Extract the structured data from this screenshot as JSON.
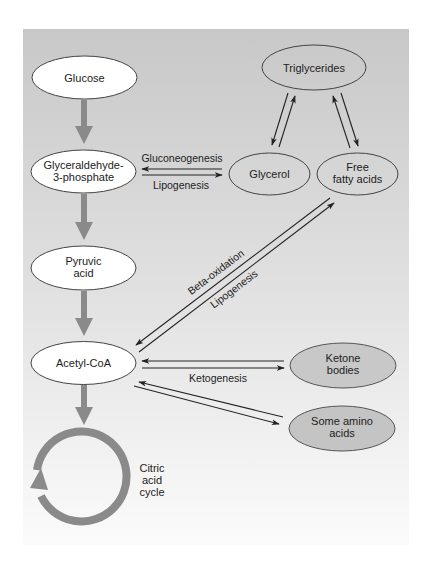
{
  "colors": {
    "panel_top": "#c9c9c9",
    "panel_bottom": "#fafafa",
    "main_arrow": "#8a8a8a",
    "node_white": "#ffffff",
    "node_gray": "#c4c4c4",
    "stroke": "#333333"
  },
  "nodes": {
    "glucose": {
      "lines": [
        "Glucose"
      ]
    },
    "g3p": {
      "lines": [
        "Glyceraldehyde-",
        "3-phosphate"
      ]
    },
    "pyruvic": {
      "lines": [
        "Pyruvic",
        "acid"
      ]
    },
    "acetyl": {
      "lines": [
        "Acetyl-CoA"
      ]
    },
    "triglycerides": {
      "lines": [
        "Triglycerides"
      ]
    },
    "glycerol": {
      "lines": [
        "Glycerol"
      ]
    },
    "ffa": {
      "lines": [
        "Free",
        "fatty acids"
      ]
    },
    "ketone": {
      "lines": [
        "Ketone",
        "bodies"
      ]
    },
    "amino": {
      "lines": [
        "Some amino",
        "acids"
      ]
    },
    "citric": {
      "lines": [
        "Citric",
        "acid",
        "cycle"
      ]
    }
  },
  "labels": {
    "gluconeogenesis": "Gluconeogenesis",
    "lipogenesis_top": "Lipogenesis",
    "beta_oxidation": "Beta-oxidation",
    "lipogenesis_diag": "Lipogenesis",
    "ketogenesis": "Ketogenesis"
  }
}
